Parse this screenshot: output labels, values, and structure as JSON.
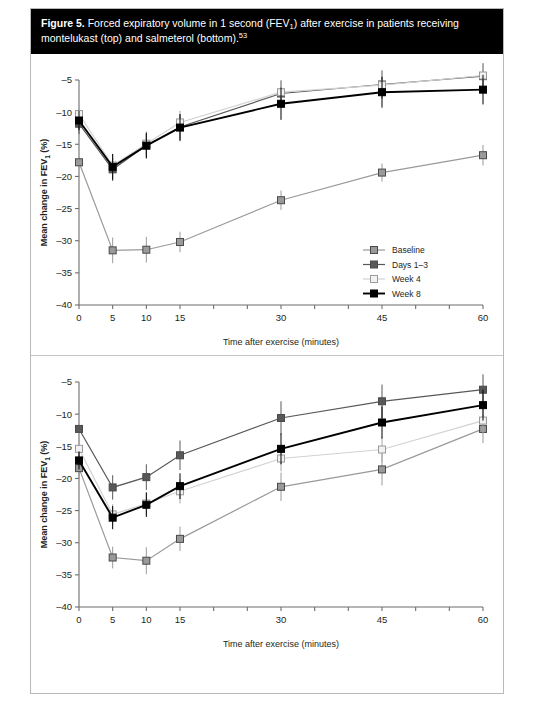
{
  "caption": {
    "figure_number": "Figure 5.",
    "text_part1": "Forced expiratory volume in 1 second (FEV",
    "sub1": "1",
    "text_part2": ") after exercise in patients receiving montelukast (top) and salmeterol (bottom).",
    "superscript": "53"
  },
  "chart_data": [
    {
      "type": "line",
      "panel": "top",
      "title": "Montelukast (top)",
      "xlabel": "Time after exercise (minutes)",
      "ylabel": "Mean change in FEV1 (%)",
      "x": [
        0,
        5,
        10,
        15,
        30,
        45,
        60
      ],
      "xticks": [
        0,
        5,
        10,
        15,
        30,
        45,
        60
      ],
      "xtick_labels": [
        "0",
        "5",
        "10",
        "15",
        "30",
        "45",
        "60"
      ],
      "xlim": [
        0,
        60
      ],
      "ylim": [
        -40,
        -5
      ],
      "yticks": [
        -5,
        -10,
        -15,
        -20,
        -25,
        -30,
        -35,
        -40
      ],
      "ytick_labels": [
        "–5",
        "–10",
        "–15",
        "–20",
        "–25",
        "–30",
        "–35",
        "–40"
      ],
      "grid": false,
      "legend_position": "right-inside",
      "series": [
        {
          "name": "Baseline",
          "color": "#9a9a9a",
          "marker": "filled-gray",
          "values": [
            -17.8,
            -31.5,
            -31.4,
            -30.2,
            -23.7,
            -19.4,
            -16.7
          ],
          "errors": [
            0.0,
            2.0,
            2.0,
            1.6,
            1.5,
            1.4,
            1.6
          ]
        },
        {
          "name": "Days 1–3",
          "color": "#585858",
          "marker": "filled-dark-gray",
          "values": [
            -11.8,
            -18.9,
            -15.2,
            -12.3,
            -7.1,
            -5.7,
            -4.4
          ],
          "errors": [
            1.6,
            1.8,
            1.9,
            2.0,
            2.0,
            2.2,
            2.0
          ]
        },
        {
          "name": "Week 4",
          "color": "#c9c9c9",
          "marker": "open-white",
          "values": [
            -10.3,
            -18.3,
            -14.9,
            -11.6,
            -6.9,
            -5.8,
            -4.3
          ],
          "errors": [
            1.4,
            1.8,
            1.9,
            1.8,
            1.9,
            2.0,
            1.9
          ]
        },
        {
          "name": "Week 8",
          "color": "#000000",
          "marker": "filled-black",
          "values": [
            -11.3,
            -18.5,
            -15.2,
            -12.4,
            -8.7,
            -6.9,
            -6.5
          ],
          "errors": [
            1.5,
            2.0,
            2.0,
            2.1,
            2.5,
            2.4,
            2.3
          ]
        }
      ]
    },
    {
      "type": "line",
      "panel": "bottom",
      "title": "Salmeterol (bottom)",
      "xlabel": "Time after exercise (minutes)",
      "ylabel": "Mean change in FEV1 (%)",
      "x": [
        0,
        5,
        10,
        15,
        30,
        45,
        60
      ],
      "xticks": [
        0,
        5,
        10,
        15,
        30,
        45,
        60
      ],
      "xtick_labels": [
        "0",
        "5",
        "10",
        "15",
        "30",
        "45",
        "60"
      ],
      "xlim": [
        0,
        60
      ],
      "ylim": [
        -40,
        -5
      ],
      "yticks": [
        -5,
        -10,
        -15,
        -20,
        -25,
        -30,
        -35,
        -40
      ],
      "ytick_labels": [
        "–5",
        "–10",
        "–15",
        "–20",
        "–25",
        "–30",
        "–35",
        "–40"
      ],
      "grid": false,
      "legend_position": "none",
      "series": [
        {
          "name": "Baseline",
          "color": "#9a9a9a",
          "marker": "filled-gray",
          "values": [
            -18.4,
            -32.3,
            -32.8,
            -29.4,
            -21.3,
            -18.6,
            -12.3
          ],
          "errors": [
            1.4,
            1.7,
            2.1,
            1.9,
            2.2,
            2.5,
            2.2
          ]
        },
        {
          "name": "Days 1–3",
          "color": "#585858",
          "marker": "filled-dark-gray",
          "values": [
            -12.3,
            -21.4,
            -19.8,
            -16.4,
            -10.6,
            -8.0,
            -6.2
          ],
          "errors": [
            0.0,
            1.9,
            2.0,
            2.3,
            2.6,
            2.6,
            2.4
          ]
        },
        {
          "name": "Week 4",
          "color": "#c9c9c9",
          "marker": "open-white",
          "values": [
            -15.4,
            -25.6,
            -23.9,
            -22.0,
            -16.9,
            -15.5,
            -11.0
          ],
          "errors": [
            1.3,
            1.6,
            1.8,
            1.9,
            2.0,
            2.0,
            2.0
          ]
        },
        {
          "name": "Week 8",
          "color": "#000000",
          "marker": "filled-black",
          "values": [
            -17.2,
            -26.1,
            -24.1,
            -21.2,
            -15.4,
            -11.3,
            -8.6
          ],
          "errors": [
            1.4,
            1.8,
            1.9,
            2.0,
            2.4,
            2.5,
            2.4
          ]
        }
      ]
    }
  ],
  "legend": {
    "items": [
      {
        "label": "Baseline",
        "color": "#9a9a9a"
      },
      {
        "label": "Days 1–3",
        "color": "#585858"
      },
      {
        "label": "Week 4",
        "color": "#c9c9c9"
      },
      {
        "label": "Week 8",
        "color": "#000000"
      }
    ]
  },
  "axis_titles": {
    "x": "Time after exercise (minutes)",
    "y_prefix": "Mean change in FEV",
    "y_sub": "1",
    "y_suffix": " (%)"
  }
}
